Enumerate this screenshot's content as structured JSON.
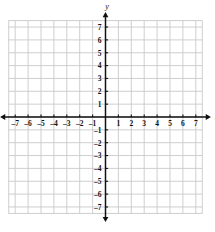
{
  "figure": {
    "type": "coordinate-grid"
  },
  "axes": {
    "x_name": "x",
    "y_name": "y",
    "origin_label": ""
  },
  "chart_data": {
    "type": "scatter",
    "title": "",
    "xlabel": "x",
    "ylabel": "y",
    "xlim": [
      -7.5,
      7.5
    ],
    "ylim": [
      -7.5,
      7.5
    ],
    "grid": true,
    "grid_step": 1,
    "legend": "none",
    "series": [],
    "x_tick_labels": [
      "-7",
      "-6",
      "-5",
      "-4",
      "-3",
      "-2",
      "-1",
      "1",
      "2",
      "3",
      "4",
      "5",
      "6",
      "7"
    ],
    "y_tick_labels": [
      "7",
      "6",
      "5",
      "4",
      "3",
      "2",
      "1",
      "-1",
      "-2",
      "-3",
      "-4",
      "-5",
      "-6",
      "-7"
    ],
    "x_ticks": [
      -7,
      -6,
      -5,
      -4,
      -3,
      -2,
      -1,
      1,
      2,
      3,
      4,
      5,
      6,
      7
    ],
    "y_ticks": [
      7,
      6,
      5,
      4,
      3,
      2,
      1,
      -1,
      -2,
      -3,
      -4,
      -5,
      -6,
      -7
    ]
  },
  "colors": {
    "grid": "#c9c9c9",
    "axis": "#111111",
    "background": "#ffffff",
    "label": "#111111"
  }
}
